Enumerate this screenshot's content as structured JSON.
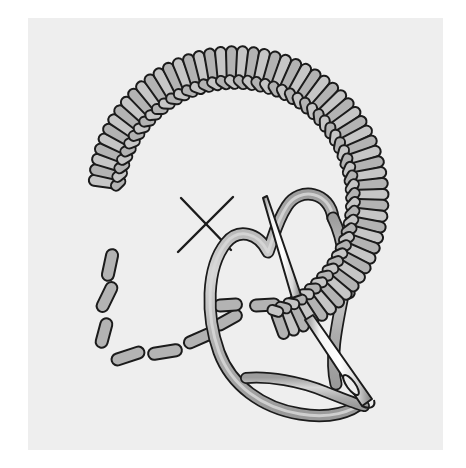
{
  "figure": {
    "kind": "embroidery-instruction-illustration",
    "alt_text": "A needlework diagram showing a buttonhole (blanket) stitch worked around the upper part of a dashed circular outline, with a threaded needle entering the fabric and a working thread looped beneath the needle.",
    "canvas": {
      "width": 466,
      "height": 468
    }
  },
  "panel": {
    "name": "illustration-panel",
    "left": 28,
    "top": 18,
    "width": 415,
    "height": 432,
    "background_color": "#eeeeee",
    "page_background_color": "#ffffff"
  },
  "palette": {
    "background": "#ffffff",
    "panel": "#eeeeee",
    "ink": "#1b1b1b",
    "stitch_fill": "#b3b3b3",
    "stitch_fill_light": "#c6c6c6",
    "thread_fill": "#b0b0b0",
    "thread_highlight": "#d2d2d2",
    "needle_metal": "#fefefe",
    "needle_shadow": "#8f8f8f",
    "dash_fill": "#b3b3b3"
  },
  "elements": {
    "stitch_arc": {
      "name": "buttonhole-stitch-arc",
      "label": "Buttonhole stitch arc",
      "description": "Row of closely packed upright stitch legs radiating outward from a twisted purl edge, sweeping clockwise from lower left, over the top, down the right side and curling inward at the lower right.",
      "stitch_count": 58,
      "center_x": 235,
      "center_y": 200,
      "inner_radius": 118,
      "leg_length": 36,
      "leg_width": 11,
      "start_angle_deg": 188,
      "end_angle_deg": 430
    },
    "purl_edge": {
      "name": "purl-edge-cord",
      "label": "Twisted purl edge",
      "description": "Braided looking cord formed where each stitch loop is caught, running along the inner side of the stitch arc.",
      "segment_count": 58
    },
    "guide_circle": {
      "name": "dashed-guide-circle",
      "label": "Dashed fabric guideline",
      "description": "Dashed ellipse marking the circle being outlined; the visible portion runs around the lower left and lower middle of the figure.",
      "dash_count": 11,
      "center_x": 235,
      "center_y": 207,
      "radius_x": 130,
      "radius_y": 125
    },
    "center_mark": {
      "name": "center-cross-mark",
      "label": "Center cross mark",
      "symbol": "X",
      "center_x": 205,
      "center_y": 224,
      "arm_length": 31,
      "stroke_width": 2.4
    },
    "working_thread": {
      "name": "working-thread",
      "label": "Working thread",
      "description": "Thread emerging at the right, arching up and over to the left, sweeping down in a long loop to the lower right and passing under the needle before going through the eye.",
      "band_width": 10
    },
    "thread_loop": {
      "name": "thread-loop-under-needle",
      "label": "Thread loop held under the needle point",
      "description": "The loop of thread laid under the needle tip so the buttonhole knot forms when the needle is pulled through."
    },
    "needle": {
      "name": "sewing-needle",
      "label": "Sewing needle",
      "description": "Long straight needle angled from upper left to lower right, passing beneath the stitches and the fabric and re-emerging, with the eye at the lower right end.",
      "tip_x": 268,
      "tip_y": 198,
      "eye_x": 368,
      "eye_y": 404,
      "width": 8
    },
    "needle_eye": {
      "name": "needle-eye",
      "label": "Needle eye",
      "description": "Elongated slot at the lower end of the needle with the thread passing through it."
    }
  },
  "annotations": {
    "stitch_type": "Buttonhole / blanket stitch",
    "worked_direction": "clockwise",
    "cross_mark_meaning": "center of the circle"
  }
}
